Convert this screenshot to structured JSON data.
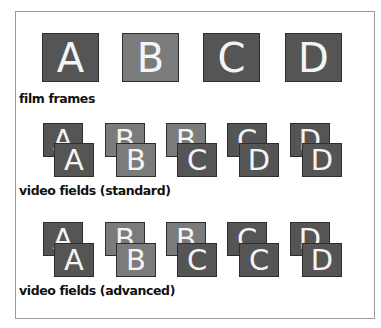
{
  "colors": {
    "dark": "#555555",
    "light": "#7b7b7b",
    "text": "#f4f4f4",
    "border": "#9a9a9a"
  },
  "film": {
    "label": "film frames",
    "frames": [
      {
        "letter": "A",
        "shade": "dark"
      },
      {
        "letter": "B",
        "shade": "light"
      },
      {
        "letter": "C",
        "shade": "dark"
      },
      {
        "letter": "D",
        "shade": "dark"
      }
    ]
  },
  "standard": {
    "label": "video fields (standard)",
    "pairs": [
      {
        "back": "A",
        "front": "A"
      },
      {
        "back": "B",
        "front": "B"
      },
      {
        "back": "B",
        "front": "C"
      },
      {
        "back": "C",
        "front": "D"
      },
      {
        "back": "D",
        "front": "D"
      }
    ]
  },
  "advanced": {
    "label": "video fields (advanced)",
    "pairs": [
      {
        "back": "A",
        "front": "A"
      },
      {
        "back": "B",
        "front": "B"
      },
      {
        "back": "B",
        "front": "C"
      },
      {
        "back": "C",
        "front": "C"
      },
      {
        "back": "D",
        "front": "D"
      }
    ]
  }
}
